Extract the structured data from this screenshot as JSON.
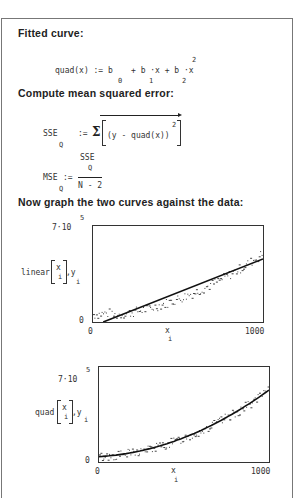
{
  "document": {
    "headings": {
      "fitted_curve": "Fitted curve:",
      "compute_mse": "Compute mean squared error:",
      "graph_curves": "Now graph the two curves against the data:"
    },
    "equations": {
      "quad": {
        "lhs": "quad(x) := b",
        "term2": "+ b ·x + b ·x",
        "sub0": "0",
        "sub1": "1",
        "sub2": "2",
        "exp": "2"
      },
      "sse": {
        "lhs": "SSE",
        "lhs_sub": "Q",
        "assign": ":=",
        "sigma": "Σ",
        "body": "(y - quad(x))",
        "exp": "2"
      },
      "mse": {
        "lhs": "MSE",
        "lhs_sub": "Q",
        "assign": ":=",
        "numerator": "SSE",
        "numerator_sub": "Q",
        "denominator": "N - 2"
      }
    }
  },
  "chart_data": [
    {
      "type": "scatter",
      "title": "linear fit vs data",
      "ylabel": "linear[x_i], y_i",
      "ylabel_main": "linear",
      "ylabel_arg": "x",
      "ylabel_arg_sub": "i",
      "ylabel_tail": ",y",
      "ylabel_tail_sub": "i",
      "xlabel": "x",
      "xlabel_sub": "i",
      "ymax_label": "7·10",
      "ymax_exp": "5",
      "ymin_label": "0",
      "xmin_label": "0",
      "xmax_label": "1000",
      "xlim": [
        0,
        1000
      ],
      "ylim": [
        0,
        700000
      ],
      "fit_line": {
        "x": [
          60,
          1000
        ],
        "y": [
          0,
          460000
        ]
      },
      "grid": false,
      "legend": "none"
    },
    {
      "type": "scatter",
      "title": "quadratic fit vs data",
      "ylabel": "quad[x_i], y_i",
      "ylabel_main": "quad",
      "ylabel_arg": "x",
      "ylabel_arg_sub": "i",
      "ylabel_tail": ",y",
      "ylabel_tail_sub": "i",
      "xlabel": "x",
      "xlabel_sub": "i",
      "ymax_label": "7·10",
      "ymax_exp": "5",
      "ymin_label": "0",
      "xmin_label": "0",
      "xmax_label": "1000",
      "xlim": [
        0,
        1000
      ],
      "ylim": [
        0,
        700000
      ],
      "fit_curve": {
        "x": [
          0,
          200,
          400,
          600,
          800,
          1000
        ],
        "y": [
          40000,
          75000,
          150000,
          270000,
          390000,
          530000
        ]
      },
      "grid": false,
      "legend": "none"
    }
  ]
}
